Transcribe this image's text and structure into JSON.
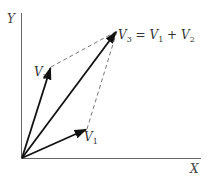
{
  "diagram": {
    "axes": {
      "x_label": "X",
      "y_label": "Y"
    },
    "vectors": [
      {
        "id": "V1",
        "name": "V",
        "sub": "1",
        "tip": [
          87,
          129
        ]
      },
      {
        "id": "V2",
        "name": "V",
        "sub": "2",
        "tip": [
          51,
          67
        ]
      },
      {
        "id": "V3",
        "name": "V",
        "sub": "3",
        "tip": [
          117,
          31
        ]
      }
    ],
    "equation": {
      "lhs_name": "V",
      "lhs_sub": "3",
      "eq": "=",
      "t1_name": "V",
      "t1_sub": "1",
      "plus": "+",
      "t2_name": "V",
      "t2_sub": "2"
    },
    "origin": [
      22,
      158
    ],
    "colors": {
      "vector": "#111111",
      "axis": "#555555",
      "dashed": "#666666"
    }
  }
}
